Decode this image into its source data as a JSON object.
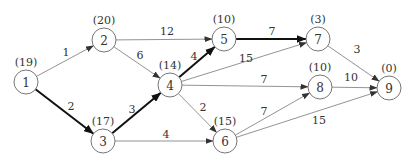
{
  "diagram": {
    "type": "directed-network",
    "nodes": [
      {
        "id": "1",
        "label": "1",
        "value": "(19)",
        "x": 26,
        "y": 82
      },
      {
        "id": "2",
        "label": "2",
        "value": "(20)",
        "x": 104,
        "y": 40
      },
      {
        "id": "3",
        "label": "3",
        "value": "(17)",
        "x": 103,
        "y": 141
      },
      {
        "id": "4",
        "label": "4",
        "value": "(14)",
        "x": 170,
        "y": 85
      },
      {
        "id": "5",
        "label": "5",
        "value": "(10)",
        "x": 224,
        "y": 39
      },
      {
        "id": "6",
        "label": "6",
        "value": "(15)",
        "x": 225,
        "y": 141
      },
      {
        "id": "7",
        "label": "7",
        "value": "(3)",
        "x": 318,
        "y": 39
      },
      {
        "id": "8",
        "label": "8",
        "value": "(10)",
        "x": 320,
        "y": 87
      },
      {
        "id": "9",
        "label": "9",
        "value": "(0)",
        "x": 389,
        "y": 88
      }
    ],
    "edges": [
      {
        "from": "1",
        "to": "2",
        "weight": "1",
        "bold": false,
        "lx": 66,
        "ly": 56
      },
      {
        "from": "1",
        "to": "3",
        "weight": "2",
        "bold": true,
        "lx": 71,
        "ly": 110
      },
      {
        "from": "2",
        "to": "5",
        "weight": "12",
        "bold": false,
        "lx": 167,
        "ly": 35
      },
      {
        "from": "2",
        "to": "4",
        "weight": "6",
        "bold": false,
        "lx": 140,
        "ly": 59
      },
      {
        "from": "3",
        "to": "4",
        "weight": "3",
        "bold": true,
        "lx": 132,
        "ly": 113
      },
      {
        "from": "3",
        "to": "6",
        "weight": "4",
        "bold": false,
        "lx": 166,
        "ly": 138
      },
      {
        "from": "4",
        "to": "5",
        "weight": "4",
        "bold": true,
        "lx": 194,
        "ly": 60
      },
      {
        "from": "4",
        "to": "7",
        "weight": "15",
        "bold": false,
        "lx": 246,
        "ly": 62
      },
      {
        "from": "4",
        "to": "8",
        "weight": "7",
        "bold": false,
        "lx": 264,
        "ly": 83
      },
      {
        "from": "4",
        "to": "6",
        "weight": "2",
        "bold": false,
        "lx": 203,
        "ly": 111
      },
      {
        "from": "5",
        "to": "7",
        "weight": "7",
        "bold": true,
        "lx": 272,
        "ly": 35
      },
      {
        "from": "7",
        "to": "9",
        "weight": "3",
        "bold": false,
        "lx": 357,
        "ly": 53
      },
      {
        "from": "8",
        "to": "9",
        "weight": "10",
        "bold": false,
        "lx": 351,
        "ly": 81
      },
      {
        "from": "6",
        "to": "8",
        "weight": "7",
        "bold": false,
        "lx": 264,
        "ly": 115
      },
      {
        "from": "6",
        "to": "9",
        "weight": "15",
        "bold": false,
        "lx": 319,
        "ly": 124
      }
    ],
    "critical_path": [
      "1",
      "3",
      "4",
      "5",
      "7",
      "9"
    ]
  }
}
